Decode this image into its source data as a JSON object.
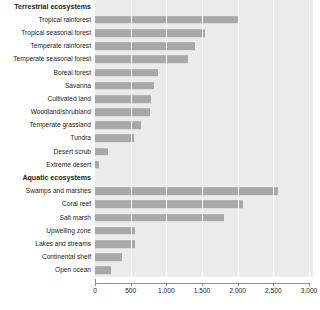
{
  "chart_data": {
    "type": "bar",
    "orientation": "horizontal",
    "title": "",
    "xlabel": "",
    "ylabel": "",
    "xlim": [
      0,
      3000
    ],
    "xticks": [
      0,
      500,
      1000,
      1500,
      2000,
      2500,
      3000
    ],
    "xtick_labels": [
      "0",
      "500",
      "1,000",
      "1,500",
      "2,000",
      "2,500",
      "3,000"
    ],
    "grid": true,
    "legend": "none",
    "bar_color": "#a8a8a8",
    "plot_background": "#ebebeb",
    "groups": [
      {
        "name": "Terrestrial ecosystems",
        "categories": [
          "Tropical rainforest",
          "Tropical seasonal forest",
          "Temperate rainforest",
          "Temperate seasonal forest",
          "Boreal forest",
          "Savanna",
          "Cultivated land",
          "Woodland/shrubland",
          "Temperate grassland",
          "Tundra",
          "Desert scrub",
          "Extreme desert"
        ],
        "values": [
          2000,
          1540,
          1400,
          1300,
          880,
          830,
          790,
          770,
          650,
          550,
          180,
          60
        ]
      },
      {
        "name": "Aquatic ecosystems",
        "categories": [
          "Swamps and marshes",
          "Coral reef",
          "Salt marsh",
          "Upwelling zone",
          "Lakes and streams",
          "Continental shelf",
          "Open ocean"
        ],
        "values": [
          2570,
          2070,
          1815,
          560,
          560,
          380,
          225
        ]
      }
    ]
  }
}
